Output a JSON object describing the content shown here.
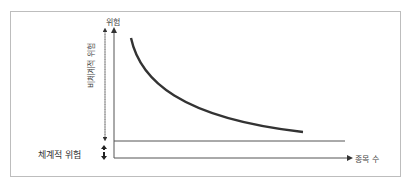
{
  "diagram": {
    "y_axis_label": "위험",
    "x_axis_label": "종목 수",
    "unsystematic_risk_label": "비체계적 위험",
    "systematic_risk_label": "체계적 위험",
    "curve_color": "#333333",
    "line_color": "#555555"
  }
}
